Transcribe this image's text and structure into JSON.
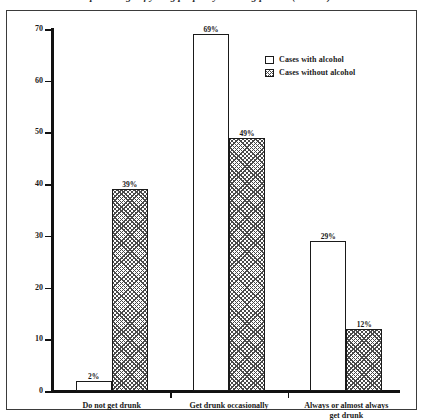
{
  "figure": {
    "clipped_title": "percentage of young people by drinking pattern (n = 000)",
    "frame": true
  },
  "chart_data": {
    "type": "bar",
    "title": "",
    "xlabel": "",
    "ylabel": "",
    "ylim": [
      0,
      70
    ],
    "yticks": [
      0,
      10,
      20,
      30,
      40,
      50,
      60,
      70
    ],
    "grid": false,
    "legend_position": "top-right",
    "categories": [
      "Do not get drunk",
      "Get drunk occasionally",
      "Always or almost always\nget drunk"
    ],
    "series": [
      {
        "name": "Cases with alcohol",
        "fill": "open",
        "values": [
          2,
          69,
          29
        ],
        "labels": [
          "2%",
          "69%",
          "29%"
        ]
      },
      {
        "name": "Cases without alcohol",
        "fill": "hatched",
        "values": [
          39,
          49,
          12
        ],
        "labels": [
          "39%",
          "49%",
          "12%"
        ]
      }
    ]
  },
  "legend": {
    "items": [
      {
        "label": "Cases with alcohol",
        "fill": "open"
      },
      {
        "label": "Cases without alcohol",
        "fill": "hatched"
      }
    ]
  },
  "colors": {
    "axis": "#111111",
    "bar_outline": "#1a1a1a",
    "hatch": "#4a4a4a",
    "open_fill": "#ffffff",
    "frame": "#3b3b3b"
  }
}
